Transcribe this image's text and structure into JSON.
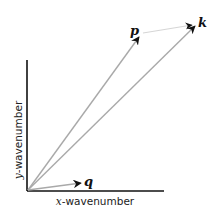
{
  "diagram": {
    "x_axis_label_var": "x",
    "x_axis_label_rest": "-wavenumber",
    "y_axis_label_var": "y",
    "y_axis_label_rest": "-wavenumber",
    "vectors": [
      {
        "name": "p",
        "label": "p",
        "color": "#a9a9a9"
      },
      {
        "name": "k",
        "label": "k",
        "color": "#a9a9a9"
      },
      {
        "name": "q",
        "label": "q",
        "color": "#a9a9a9"
      }
    ],
    "connector": {
      "from": "p",
      "to": "k",
      "color": "#d6d6d6"
    },
    "axis_color": "#111111",
    "arrowhead_color": "#111111"
  }
}
